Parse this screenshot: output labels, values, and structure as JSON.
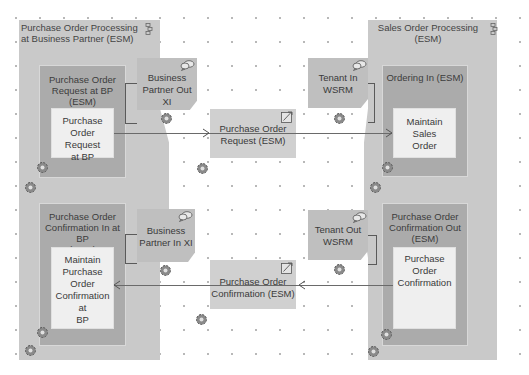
{
  "diagram": {
    "pools": [
      {
        "title": "Purchase Order Processing at Business Partner  (ESM)",
        "title_line1": "Purchase Order Processing",
        "title_line2": "at Business Partner  (ESM)"
      },
      {
        "title": "Sales Order Processing (ESM)",
        "title_line1": "Sales Order Processing",
        "title_line2": "(ESM)"
      }
    ],
    "components": [
      {
        "title_line1": "Purchase Order",
        "title_line2": "Request at BP (ESM)",
        "operation": [
          "Purchase",
          "Order Request",
          "at BP"
        ]
      },
      {
        "title_line1": "Purchase Order",
        "title_line2": "Confirmation In at BP",
        "title_line3": "(ESM)",
        "operation": [
          "Maintain",
          "Purchase",
          "Order",
          "Confirmation at",
          "BP"
        ]
      },
      {
        "title_line1": "Ordering In (ESM)",
        "operation": [
          "Maintain Sales",
          "Order"
        ]
      },
      {
        "title_line1": "Purchase Order",
        "title_line2": "Confirmation Out",
        "title_line3": "(ESM)",
        "operation": [
          "Purchase",
          "Order",
          "Confirmation"
        ]
      }
    ],
    "endpoints": [
      {
        "line1": "Business",
        "line2": "Partner Out XI"
      },
      {
        "line1": "Business",
        "line2": "Partner In XI"
      },
      {
        "line1": "Tenant In",
        "line2": "WSRM"
      },
      {
        "line1": "Tenant Out",
        "line2": "WSRM"
      }
    ],
    "messages": [
      {
        "line1": "Purchase Order",
        "line2": "Request (ESM)"
      },
      {
        "line1": "Purchase Order",
        "line2": "Confirmation (ESM)"
      }
    ],
    "icons": {
      "pool": "process-component-icon",
      "endpoint": "communication-channel-icon",
      "message": "message-type-icon",
      "config": "gear-icon"
    },
    "colors": {
      "pool": "#c9c9c9",
      "component": "#ababab",
      "operation": "#efefef",
      "endpoint": "#bfbfbf",
      "message": "#d0d0d0",
      "connector": "#6a6a6a"
    }
  }
}
